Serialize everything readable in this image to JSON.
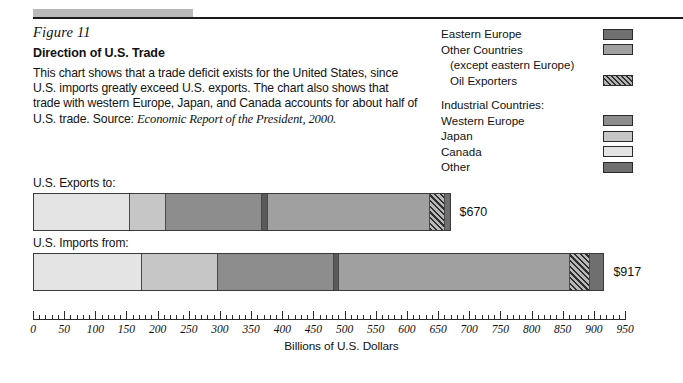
{
  "figure": {
    "number": "Figure 11",
    "title": "Direction of U.S. Trade",
    "body": "This chart shows that a trade deficit exists for the United States, since U.S. imports greatly exceed U.S. exports. The chart also shows that trade with western Europe, Japan, and Canada accounts for about half of U.S. trade. Source:",
    "source": "Economic Report of the President, 2000."
  },
  "legend": {
    "rows": [
      {
        "label": "Eastern Europe",
        "swatch": "#6f6f6f",
        "pattern": "solid",
        "indent": false
      },
      {
        "label": "Other Countries",
        "swatch": "#a0a0a0",
        "pattern": "solid",
        "indent": false
      },
      {
        "label": "(except eastern Europe)",
        "swatch": null,
        "pattern": "none",
        "indent": true
      },
      {
        "label": "Oil Exporters",
        "swatch": "#8e8e8e",
        "pattern": "hatch",
        "indent": true
      }
    ],
    "group_heading": "Industrial Countries:",
    "group_rows": [
      {
        "label": "Western Europe",
        "swatch": "#8d8d8d",
        "pattern": "solid"
      },
      {
        "label": "Japan",
        "swatch": "#c6c6c6",
        "pattern": "solid"
      },
      {
        "label": "Canada",
        "swatch": "#e4e4e4",
        "pattern": "solid"
      },
      {
        "label": "Other",
        "swatch": "#6f6f6f",
        "pattern": "solid"
      }
    ]
  },
  "chart_data": {
    "type": "bar",
    "orientation": "horizontal",
    "stacked": true,
    "title": "Direction of U.S. Trade",
    "xlabel": "Billions of U.S. Dollars",
    "ylabel": "",
    "xlim": [
      0,
      950
    ],
    "xticks": [
      0,
      50,
      100,
      150,
      200,
      250,
      300,
      350,
      400,
      450,
      500,
      550,
      600,
      650,
      700,
      750,
      800,
      850,
      900,
      950
    ],
    "xtick_labels": [
      "0",
      "50",
      "100",
      "150",
      "200",
      "250",
      "300",
      "350",
      "400",
      "450",
      "500",
      "550",
      "600",
      "650",
      "700",
      "750",
      "800",
      "850",
      "900",
      "950"
    ],
    "minor_tick_step": 10,
    "grid": false,
    "legend_position": "top-right",
    "categories": [
      "U.S. Exports to:",
      "U.S. Imports from:"
    ],
    "series": [
      {
        "name": "Canada",
        "color": "#e4e4e4",
        "pattern": "solid",
        "values": [
          152,
          172
        ]
      },
      {
        "name": "Japan",
        "color": "#c6c6c6",
        "pattern": "solid",
        "values": [
          58,
          122
        ]
      },
      {
        "name": "Western Europe",
        "color": "#8d8d8d",
        "pattern": "solid",
        "values": [
          154,
          186
        ]
      },
      {
        "name": "Other",
        "color": "#5a5a5a",
        "pattern": "solid",
        "values": [
          10,
          8
        ]
      },
      {
        "name": "Other Countries",
        "color": "#a0a0a0",
        "pattern": "solid",
        "values": [
          260,
          370
        ]
      },
      {
        "name": "Oil Exporters",
        "color": "#8e8e8e",
        "pattern": "hatch",
        "values": [
          24,
          32
        ]
      },
      {
        "name": "Eastern Europe",
        "color": "#6f6f6f",
        "pattern": "solid",
        "values": [
          12,
          27
        ]
      }
    ],
    "totals": [
      "$670",
      "$917"
    ],
    "total_values": [
      670,
      917
    ]
  },
  "bars": [
    {
      "label": "U.S. Exports to:",
      "total": "$670"
    },
    {
      "label": "U.S. Imports from:",
      "total": "$917"
    }
  ]
}
